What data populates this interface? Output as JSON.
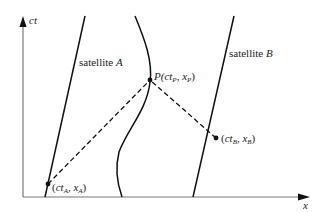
{
  "diagram": {
    "type": "spacetime-diagram",
    "axes": {
      "vertical_label": "ct",
      "horizontal_label": "x",
      "axis_color": "#999999",
      "arrow_color": "#111111"
    },
    "worldlines": [
      {
        "name": "satellite A",
        "label_text": "satellite ",
        "label_letter": "A"
      },
      {
        "name": "receiver (curved worldline)"
      },
      {
        "name": "satellite B",
        "label_text": "satellite ",
        "label_letter": "B"
      }
    ],
    "events": {
      "P": {
        "prefix": "P(",
        "ct": "ct",
        "ct_sub": "P",
        "sep": ", ",
        "x": "x",
        "x_sub": "P",
        "suffix": ")"
      },
      "A": {
        "prefix": "(",
        "ct": "ct",
        "ct_sub": "A",
        "sep": ", ",
        "x": "x",
        "x_sub": "A",
        "suffix": ")"
      },
      "B": {
        "prefix": "(",
        "ct": "ct",
        "ct_sub": "B",
        "sep": ", ",
        "x": "x",
        "x_sub": "B",
        "suffix": ")"
      }
    },
    "signals": [
      {
        "from": "A",
        "to": "P",
        "style": "dashed"
      },
      {
        "from": "B",
        "to": "P",
        "style": "dashed"
      }
    ]
  }
}
